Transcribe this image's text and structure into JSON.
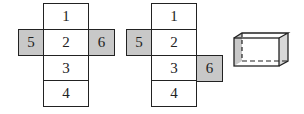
{
  "nets": [
    {
      "name": "net-a",
      "cells": [
        {
          "label": "1",
          "x": 43,
          "y": 3,
          "w": 46,
          "h": 27,
          "shaded": false
        },
        {
          "label": "2",
          "x": 43,
          "y": 29,
          "w": 46,
          "h": 27,
          "shaded": false
        },
        {
          "label": "3",
          "x": 43,
          "y": 55,
          "w": 46,
          "h": 27,
          "shaded": false
        },
        {
          "label": "4",
          "x": 43,
          "y": 80,
          "w": 46,
          "h": 27,
          "shaded": false
        },
        {
          "label": "5",
          "x": 18,
          "y": 29,
          "w": 26,
          "h": 27,
          "shaded": true
        },
        {
          "label": "6",
          "x": 88,
          "y": 29,
          "w": 27,
          "h": 27,
          "shaded": true
        }
      ]
    },
    {
      "name": "net-b",
      "cells": [
        {
          "label": "1",
          "x": 151,
          "y": 3,
          "w": 46,
          "h": 27,
          "shaded": false
        },
        {
          "label": "2",
          "x": 151,
          "y": 29,
          "w": 46,
          "h": 27,
          "shaded": false
        },
        {
          "label": "3",
          "x": 151,
          "y": 55,
          "w": 46,
          "h": 27,
          "shaded": false
        },
        {
          "label": "4",
          "x": 151,
          "y": 80,
          "w": 46,
          "h": 27,
          "shaded": false
        },
        {
          "label": "5",
          "x": 126,
          "y": 29,
          "w": 26,
          "h": 27,
          "shaded": true
        },
        {
          "label": "6",
          "x": 196,
          "y": 55,
          "w": 27,
          "h": 27,
          "shaded": true
        }
      ]
    }
  ],
  "box": {
    "name": "rectangular-prism",
    "label": "cuboid"
  },
  "colors": {
    "line": "#222222",
    "shade": "#c8c8c8"
  }
}
